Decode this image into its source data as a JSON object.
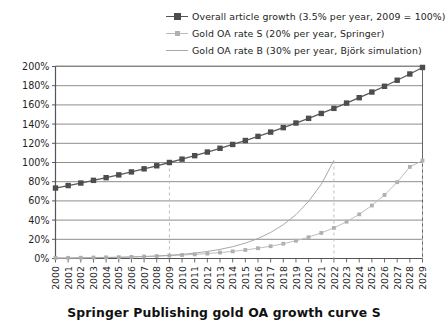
{
  "chart_data": {
    "type": "line",
    "title": "Springer Publishing gold OA growth curve S",
    "xlabel": "",
    "ylabel": "",
    "ylim": [
      0,
      200
    ],
    "yticks": [
      "0%",
      "20%",
      "40%",
      "60%",
      "80%",
      "100%",
      "120%",
      "140%",
      "160%",
      "180%",
      "200%"
    ],
    "ytick_values": [
      0,
      20,
      40,
      60,
      80,
      100,
      120,
      140,
      160,
      180,
      200
    ],
    "grid": true,
    "legend_position": "top-right",
    "categories": [
      "2000",
      "2001",
      "2002",
      "2003",
      "2004",
      "2005",
      "2006",
      "2007",
      "2008",
      "2009",
      "2010",
      "2011",
      "2012",
      "2013",
      "2014",
      "2015",
      "2016",
      "2017",
      "2018",
      "2019",
      "2020",
      "2021",
      "2022",
      "2023",
      "2024",
      "2025",
      "2026",
      "2027",
      "2028",
      "2029"
    ],
    "series": [
      {
        "name": "Overall article growth (3.5% per year, 2009 = 100%)",
        "marker": "square",
        "color": "#4d4d4d",
        "line_color": "#595959",
        "values": [
          73.4,
          76.0,
          78.6,
          81.4,
          84.2,
          87.1,
          90.2,
          93.4,
          96.6,
          100.0,
          103.5,
          107.1,
          110.9,
          114.8,
          118.8,
          122.9,
          127.2,
          131.7,
          136.3,
          141.1,
          146.0,
          151.1,
          156.4,
          161.9,
          167.5,
          173.4,
          179.4,
          185.7,
          192.2,
          199.0
        ]
      },
      {
        "name": "Gold OA rate S (20% per year, Springer)",
        "marker": "small-square",
        "color": "#b0b0b0",
        "line_color": "#bdbdbd",
        "values": [
          0.6,
          0.7,
          0.8,
          1.0,
          1.2,
          1.4,
          1.7,
          2.1,
          2.5,
          3.0,
          3.6,
          4.3,
          5.1,
          6.2,
          7.4,
          8.9,
          10.7,
          12.8,
          15.4,
          18.5,
          22.2,
          26.6,
          31.9,
          38.3,
          46.0,
          55.2,
          66.2,
          79.5,
          95.4,
          102.0
        ]
      },
      {
        "name": "Gold OA rate B (30% per year, Björk simulation)",
        "marker": "none",
        "color": "#a8a8a8",
        "line_color": "#a8a8a8",
        "values": [
          0.3,
          0.4,
          0.5,
          0.7,
          0.9,
          1.2,
          1.5,
          2.0,
          2.6,
          3.3,
          4.3,
          5.6,
          7.3,
          9.5,
          12.3,
          16.0,
          20.8,
          27.1,
          35.2,
          45.7,
          59.5,
          77.3,
          102.0,
          null,
          null,
          null,
          null,
          null,
          null,
          null
        ]
      }
    ],
    "annotations": [
      {
        "type": "vline",
        "x": "2009",
        "y": 100,
        "style": "dashed",
        "color": "#bfbfbf"
      },
      {
        "type": "vline",
        "x": "2022",
        "y": 102,
        "style": "dashed",
        "color": "#bfbfbf"
      },
      {
        "type": "vline",
        "x": "2029",
        "y": 102,
        "style": "dashed",
        "color": "#bfbfbf"
      }
    ]
  },
  "legend": {
    "items": [
      {
        "label": "Overall article growth (3.5% per year, 2009 = 100%)"
      },
      {
        "label": "Gold OA rate S (20% per year, Springer)"
      },
      {
        "label": "Gold OA rate B (30% per year, Björk simulation)"
      }
    ]
  }
}
